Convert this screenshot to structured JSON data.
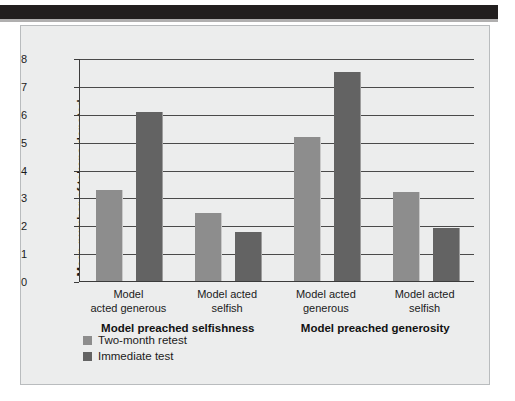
{
  "figure": {
    "background_color": "#eceded",
    "top_band_color": "#221f1f"
  },
  "chart_data": {
    "type": "bar",
    "title": "",
    "xlabel": "",
    "ylabel": "Mean number of tokens donated",
    "ylim": [
      0,
      8
    ],
    "yticks": [
      "0",
      "1",
      "2",
      "3",
      "4",
      "5",
      "6",
      "7",
      "8"
    ],
    "grid": true,
    "legend_position": "bottom-left",
    "categories": [
      "Model acted generous",
      "Model acted selfish",
      "Model acted generous",
      "Model acted selfish"
    ],
    "category_lines": [
      [
        "Model",
        "acted generous"
      ],
      [
        "Model acted",
        "selfish"
      ],
      [
        "Model acted",
        "generous"
      ],
      [
        "Model acted",
        "selfish"
      ]
    ],
    "supergroups": [
      {
        "label": "Model preached selfishness",
        "categories": [
          0,
          1
        ]
      },
      {
        "label": "Model preached generosity",
        "categories": [
          2,
          3
        ]
      }
    ],
    "series": [
      {
        "name": "Two-month retest",
        "color": "#8d8d8d",
        "values": [
          3.25,
          2.45,
          5.15,
          3.2
        ]
      },
      {
        "name": "Immediate test",
        "color": "#636363",
        "values": [
          6.05,
          1.75,
          7.5,
          1.9
        ]
      }
    ]
  },
  "legend": {
    "items": [
      {
        "label": "Two-month retest",
        "swatch": "light"
      },
      {
        "label": "Immediate test",
        "swatch": "dark"
      }
    ]
  }
}
